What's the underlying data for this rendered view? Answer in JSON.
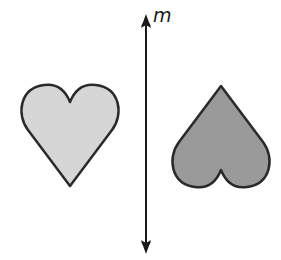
{
  "diagram": {
    "line": {
      "label": "m",
      "color": "#1a1a1a"
    },
    "left_heart": {
      "fill": "#d6d6d6",
      "stroke": "#2a2a2a",
      "orientation": "upright"
    },
    "right_heart": {
      "fill": "#9a9a9a",
      "stroke": "#2a2a2a",
      "orientation": "inverted"
    }
  }
}
